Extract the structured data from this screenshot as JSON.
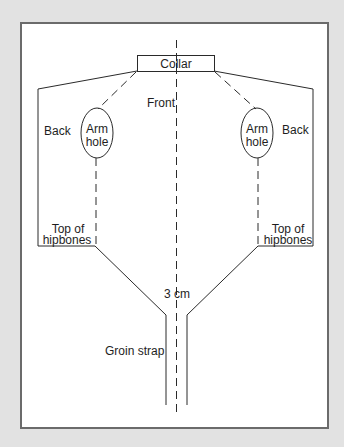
{
  "diagram": {
    "type": "garment-pattern",
    "labels": {
      "collar": "Collar",
      "front": "Front",
      "back_left": "Back",
      "back_right": "Back",
      "armhole_left_line1": "Arm",
      "armhole_left_line2": "hole",
      "armhole_right_line1": "Arm",
      "armhole_right_line2": "hole",
      "hip_left_line1": "Top of",
      "hip_left_line2": "hipbones",
      "hip_right_line1": "Top of",
      "hip_right_line2": "hipbones",
      "strap_width": "3 cm",
      "groin_strap": "Groin strap"
    },
    "colors": {
      "frame": "#e2e2e2",
      "border": "#6b6b6b",
      "ink": "#2a2a2a",
      "paper": "#ffffff"
    }
  }
}
